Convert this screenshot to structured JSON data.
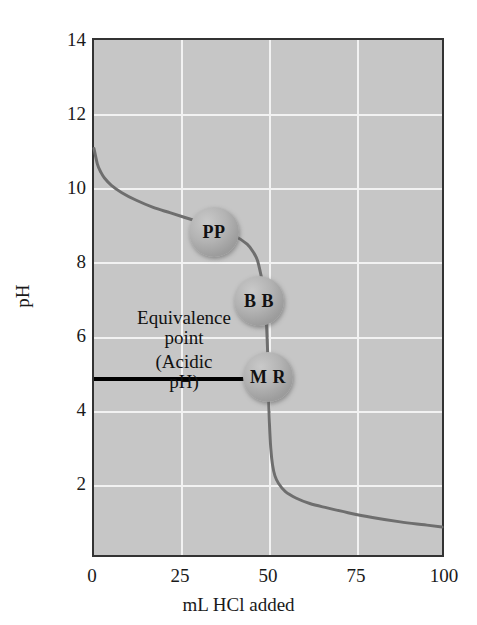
{
  "figure": {
    "background_color": "#ffffff",
    "plot_background_color": "#c6c6c6",
    "grid_color": "#f2f2f2",
    "frame_color": "#333333",
    "curve_color": "#6e6e6e",
    "equivalence_line_color": "#000000",
    "bubble_color": "#a8a8a8"
  },
  "chart_data": {
    "type": "line",
    "title": "",
    "xlabel": "mL HCl added",
    "ylabel": "pH",
    "xlim": [
      0,
      100
    ],
    "ylim": [
      0,
      14
    ],
    "xticks": [
      "0",
      "25",
      "50",
      "75",
      "100"
    ],
    "xtick_values": [
      0,
      25,
      50,
      75,
      100
    ],
    "yticks": [
      "2",
      "4",
      "6",
      "8",
      "10",
      "12",
      "14"
    ],
    "ytick_values": [
      2,
      4,
      6,
      8,
      10,
      12,
      14
    ],
    "grid": true,
    "grid_vertical_at": [
      25,
      50,
      75
    ],
    "grid_horizontal_at": [
      2,
      4,
      6,
      8,
      10,
      12
    ],
    "legend": "none",
    "series": [
      {
        "name": "Titration of weak base with HCl",
        "x": [
          0,
          1,
          2,
          3,
          5,
          8,
          12,
          17,
          22,
          28,
          34,
          40,
          44,
          46,
          47,
          48,
          48.7,
          49.2,
          49.6,
          49.9,
          50,
          50.1,
          50.4,
          50.8,
          51.3,
          52,
          53,
          55,
          58,
          62,
          67,
          73,
          80,
          88,
          95,
          100
        ],
        "y": [
          11.05,
          10.62,
          10.4,
          10.25,
          10.05,
          9.85,
          9.65,
          9.45,
          9.3,
          9.12,
          8.95,
          8.7,
          8.45,
          8.2,
          8.0,
          7.6,
          7.25,
          6.8,
          6.2,
          5.5,
          5.0,
          4.5,
          3.6,
          2.9,
          2.45,
          2.15,
          1.95,
          1.72,
          1.55,
          1.4,
          1.28,
          1.15,
          1.02,
          0.9,
          0.82,
          0.76
        ]
      }
    ],
    "annotations": [
      {
        "name": "equivalence-point-line",
        "label": "Equivalence\npoint\n(Acidic\npH)",
        "label_lines": [
          "Equivalence",
          "point",
          "(Acidic",
          "pH)"
        ],
        "y_value": 5.0,
        "x_from": 0,
        "x_to": 49
      }
    ],
    "markers": [
      {
        "name": "phenolphthalein",
        "label": "PP",
        "x": 34.5,
        "y": 9.0
      },
      {
        "name": "bromthymol-blue",
        "label": "B B",
        "x": 47.5,
        "y": 7.05
      },
      {
        "name": "methyl-red",
        "label": "M R",
        "x": 50.0,
        "y": 4.95
      }
    ]
  },
  "axes": {
    "y_label": "pH",
    "x_label": "mL HCl added",
    "y_ticks": [
      "14",
      "12",
      "10",
      "8",
      "6",
      "4",
      "2"
    ],
    "x_ticks": [
      "0",
      "25",
      "50",
      "75",
      "100"
    ]
  },
  "annotation_text": {
    "line1": "Equivalence",
    "line2": "point",
    "line3": "(Acidic",
    "line4": "pH)"
  },
  "markers": {
    "pp": "PP",
    "bb": "B B",
    "mr": "M R"
  }
}
